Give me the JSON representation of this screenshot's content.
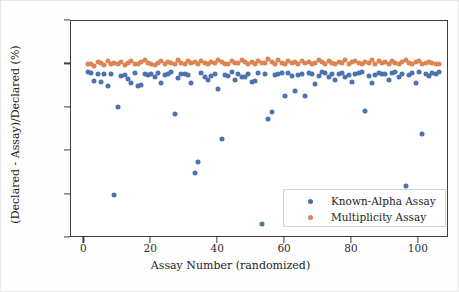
{
  "chart_data": {
    "type": "scatter",
    "title": "",
    "xlabel": "Assay Number (randomized)",
    "ylabel": "(Declared - Assay)/Declared (%)",
    "xlim": [
      -4,
      109
    ],
    "ylim": [
      -400,
      100
    ],
    "xticks": [
      0,
      20,
      40,
      60,
      80,
      100
    ],
    "xticklabels": [
      "0",
      "20",
      "40",
      "60",
      "80",
      "100"
    ],
    "yticks": [
      -400,
      -300,
      -200,
      -100,
      0,
      100
    ],
    "yticklabels": [
      "-400",
      "-300",
      "-200",
      "-100",
      "0",
      "100"
    ],
    "grid": false,
    "legend_position": "lower right",
    "colors": {
      "series0": "#4c72b0",
      "series1": "#dd8452"
    },
    "series": [
      {
        "name": "Known-Alpha Assay",
        "color": "#4c72b0",
        "marker": "o",
        "points": [
          [
            1,
            -18
          ],
          [
            2,
            -19
          ],
          [
            3,
            -39
          ],
          [
            4,
            -22
          ],
          [
            5,
            -41
          ],
          [
            6,
            -21
          ],
          [
            7,
            -49
          ],
          [
            8,
            -22
          ],
          [
            9,
            -300
          ],
          [
            10,
            -98
          ],
          [
            11,
            -26
          ],
          [
            12,
            -24
          ],
          [
            13,
            -34
          ],
          [
            14,
            -44
          ],
          [
            15,
            -20
          ],
          [
            16,
            -49
          ],
          [
            17,
            -48
          ],
          [
            18,
            -23
          ],
          [
            19,
            -25
          ],
          [
            20,
            -21
          ],
          [
            21,
            -28
          ],
          [
            22,
            -19
          ],
          [
            23,
            -44
          ],
          [
            24,
            -24
          ],
          [
            25,
            -22
          ],
          [
            26,
            -18
          ],
          [
            27,
            -115
          ],
          [
            28,
            -32
          ],
          [
            29,
            -23
          ],
          [
            30,
            -21
          ],
          [
            31,
            -25
          ],
          [
            32,
            -42
          ],
          [
            33,
            -250
          ],
          [
            34,
            -225
          ],
          [
            35,
            -20
          ],
          [
            36,
            -28
          ],
          [
            37,
            -35
          ],
          [
            38,
            -26
          ],
          [
            39,
            -22
          ],
          [
            40,
            -56
          ],
          [
            41,
            -173
          ],
          [
            42,
            -24
          ],
          [
            43,
            -27
          ],
          [
            44,
            -18
          ],
          [
            45,
            -36
          ],
          [
            46,
            -22
          ],
          [
            47,
            -30
          ],
          [
            48,
            -29
          ],
          [
            49,
            -23
          ],
          [
            50,
            -40
          ],
          [
            51,
            -38
          ],
          [
            52,
            -20
          ],
          [
            53,
            -368
          ],
          [
            54,
            -22
          ],
          [
            55,
            -125
          ],
          [
            56,
            -110
          ],
          [
            57,
            -25
          ],
          [
            58,
            -22
          ],
          [
            59,
            -19
          ],
          [
            60,
            -73
          ],
          [
            61,
            -20
          ],
          [
            62,
            -26
          ],
          [
            63,
            -62
          ],
          [
            64,
            -24
          ],
          [
            65,
            -21
          ],
          [
            66,
            -72
          ],
          [
            67,
            -19
          ],
          [
            68,
            -23
          ],
          [
            69,
            -45
          ],
          [
            70,
            -26
          ],
          [
            71,
            -18
          ],
          [
            72,
            -20
          ],
          [
            73,
            -30
          ],
          [
            74,
            -22
          ],
          [
            75,
            -36
          ],
          [
            76,
            -21
          ],
          [
            77,
            -19
          ],
          [
            78,
            -28
          ],
          [
            79,
            -24
          ],
          [
            80,
            -40
          ],
          [
            81,
            -22
          ],
          [
            82,
            -20
          ],
          [
            83,
            -18
          ],
          [
            84,
            -108
          ],
          [
            85,
            -26
          ],
          [
            86,
            -42
          ],
          [
            87,
            -24
          ],
          [
            88,
            -19
          ],
          [
            89,
            -21
          ],
          [
            90,
            -23
          ],
          [
            91,
            -35
          ],
          [
            92,
            -20
          ],
          [
            93,
            -18
          ],
          [
            94,
            -28
          ],
          [
            95,
            -22
          ],
          [
            96,
            -280
          ],
          [
            97,
            -24
          ],
          [
            98,
            -20
          ],
          [
            99,
            -44
          ],
          [
            100,
            -18
          ],
          [
            101,
            -160
          ],
          [
            102,
            -22
          ],
          [
            103,
            -26
          ],
          [
            104,
            -19
          ],
          [
            105,
            -21
          ],
          [
            106,
            -17
          ]
        ]
      },
      {
        "name": "Multiplicity Assay",
        "color": "#dd8452",
        "marker": "o",
        "points": [
          [
            1,
            2
          ],
          [
            2,
            1
          ],
          [
            3,
            -3
          ],
          [
            4,
            5
          ],
          [
            5,
            3
          ],
          [
            6,
            -2
          ],
          [
            7,
            8
          ],
          [
            8,
            2
          ],
          [
            9,
            4
          ],
          [
            10,
            1
          ],
          [
            11,
            6
          ],
          [
            12,
            -1
          ],
          [
            13,
            3
          ],
          [
            14,
            7
          ],
          [
            15,
            2
          ],
          [
            16,
            0
          ],
          [
            17,
            5
          ],
          [
            18,
            9
          ],
          [
            19,
            3
          ],
          [
            20,
            1
          ],
          [
            21,
            -2
          ],
          [
            22,
            4
          ],
          [
            23,
            8
          ],
          [
            24,
            2
          ],
          [
            25,
            6
          ],
          [
            26,
            3
          ],
          [
            27,
            1
          ],
          [
            28,
            10
          ],
          [
            29,
            4
          ],
          [
            30,
            2
          ],
          [
            31,
            7
          ],
          [
            32,
            3
          ],
          [
            33,
            5
          ],
          [
            34,
            1
          ],
          [
            35,
            8
          ],
          [
            36,
            4
          ],
          [
            37,
            2
          ],
          [
            38,
            6
          ],
          [
            39,
            3
          ],
          [
            40,
            9
          ],
          [
            41,
            5
          ],
          [
            42,
            2
          ],
          [
            43,
            0
          ],
          [
            44,
            7
          ],
          [
            45,
            4
          ],
          [
            46,
            3
          ],
          [
            47,
            11
          ],
          [
            48,
            6
          ],
          [
            49,
            2
          ],
          [
            50,
            5
          ],
          [
            51,
            1
          ],
          [
            52,
            8
          ],
          [
            53,
            3
          ],
          [
            54,
            4
          ],
          [
            55,
            12
          ],
          [
            56,
            6
          ],
          [
            57,
            2
          ],
          [
            58,
            9
          ],
          [
            59,
            4
          ],
          [
            60,
            1
          ],
          [
            61,
            7
          ],
          [
            62,
            3
          ],
          [
            63,
            5
          ],
          [
            64,
            2
          ],
          [
            65,
            8
          ],
          [
            66,
            4
          ],
          [
            67,
            6
          ],
          [
            68,
            1
          ],
          [
            69,
            3
          ],
          [
            70,
            10
          ],
          [
            71,
            5
          ],
          [
            72,
            2
          ],
          [
            73,
            7
          ],
          [
            74,
            4
          ],
          [
            75,
            0
          ],
          [
            76,
            6
          ],
          [
            77,
            3
          ],
          [
            78,
            9
          ],
          [
            79,
            2
          ],
          [
            80,
            5
          ],
          [
            81,
            8
          ],
          [
            82,
            3
          ],
          [
            83,
            1
          ],
          [
            84,
            6
          ],
          [
            85,
            4
          ],
          [
            86,
            11
          ],
          [
            87,
            2
          ],
          [
            88,
            7
          ],
          [
            89,
            3
          ],
          [
            90,
            5
          ],
          [
            91,
            0
          ],
          [
            92,
            8
          ],
          [
            93,
            4
          ],
          [
            94,
            2
          ],
          [
            95,
            6
          ],
          [
            96,
            9
          ],
          [
            97,
            3
          ],
          [
            98,
            1
          ],
          [
            99,
            5
          ],
          [
            100,
            7
          ],
          [
            101,
            2
          ],
          [
            102,
            4
          ],
          [
            103,
            6
          ],
          [
            104,
            3
          ],
          [
            105,
            1
          ],
          [
            106,
            2
          ]
        ]
      }
    ]
  },
  "legend": {
    "entries": [
      {
        "label": "Known-Alpha Assay",
        "color": "#4c72b0"
      },
      {
        "label": "Multiplicity Assay",
        "color": "#dd8452"
      }
    ]
  }
}
